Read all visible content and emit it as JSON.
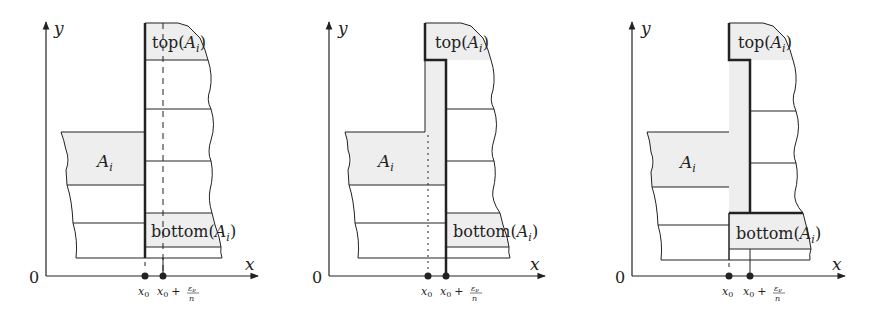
{
  "colors": {
    "stroke": "#222222",
    "fill_shaded": "#eeeeee",
    "background": "#ffffff"
  },
  "labels": {
    "y_axis": "y",
    "x_axis": "x",
    "origin": "0",
    "set": "A",
    "set_sub": "i",
    "top_prefix": "top(",
    "bottom_prefix": "bottom(",
    "close_paren": ")",
    "x0": "x",
    "x0_sub": "0",
    "plus": "+",
    "eps": "ε",
    "eps_sub": "ν",
    "n": "n"
  },
  "panels": [
    {
      "id": "panel-1",
      "offset_x": 0,
      "x0": 145,
      "x1": 163,
      "variant": "dashed-guide"
    },
    {
      "id": "panel-2",
      "offset_x": 283,
      "x0": 428,
      "x1": 446,
      "variant": "strip-shaded-top-and-left"
    },
    {
      "id": "panel-3",
      "offset_x": 586,
      "x0": 731,
      "x1": 750,
      "variant": "strip-shaded-full"
    }
  ]
}
